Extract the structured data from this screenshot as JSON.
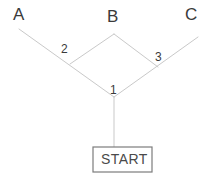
{
  "diagram": {
    "type": "decision-tree",
    "canvas": {
      "width": 212,
      "height": 174,
      "background": "#ffffff"
    },
    "style": {
      "line_color": "#c9c9c9",
      "box_border_color": "#7c7c7c",
      "text_color": "#3a3a3a",
      "box_fill": "#ffffff"
    },
    "start": {
      "label": "START",
      "box": {
        "x": 93,
        "y": 147,
        "width": 59,
        "height": 25
      }
    },
    "nodes": [
      {
        "id": "1",
        "label": "1",
        "x": 114,
        "y": 97,
        "label_x": 110,
        "label_y": 84
      },
      {
        "id": "2",
        "label": "2",
        "x": 70,
        "y": 64,
        "label_x": 61,
        "label_y": 43
      },
      {
        "id": "3",
        "label": "3",
        "x": 158,
        "y": 67,
        "label_x": 155,
        "label_y": 51
      }
    ],
    "terminals": [
      {
        "id": "A",
        "label": "A",
        "label_x": 13,
        "label_y": 6,
        "line_end_x": 19,
        "line_end_y": 29
      },
      {
        "id": "B",
        "label": "B",
        "label_x": 107,
        "label_y": 8,
        "line_end_x": 114,
        "line_end_y": 34
      },
      {
        "id": "C",
        "label": "C",
        "label_x": 185,
        "label_y": 6,
        "line_end_x": 198,
        "line_end_y": 37
      }
    ],
    "edges": [
      {
        "name": "start-to-node1",
        "from": "START",
        "to": "1",
        "x1": 114,
        "y1": 147,
        "x2": 114,
        "y2": 97
      },
      {
        "name": "node1-to-A",
        "from": "1",
        "to": "A",
        "x1": 114,
        "y1": 97,
        "x2": 19,
        "y2": 29
      },
      {
        "name": "node1-to-C",
        "from": "1",
        "to": "C",
        "x1": 114,
        "y1": 97,
        "x2": 198,
        "y2": 37
      },
      {
        "name": "node2-to-B",
        "from": "2",
        "to": "B",
        "x1": 70,
        "y1": 64,
        "x2": 114,
        "y2": 34
      },
      {
        "name": "node3-to-B",
        "from": "3",
        "to": "B",
        "x1": 158,
        "y1": 67,
        "x2": 114,
        "y2": 34
      }
    ]
  }
}
